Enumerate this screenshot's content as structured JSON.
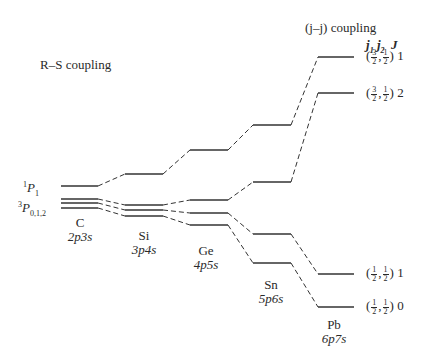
{
  "titles": {
    "rs": "R–S coupling",
    "jj": "(j–j) coupling"
  },
  "jj_header": {
    "j1": "j",
    "j1_sub": "1",
    "j2": "j",
    "j2_sub": "2",
    "J": "J"
  },
  "rs_terms": {
    "singlet": {
      "sup": "1",
      "letter": "P",
      "sub": "1"
    },
    "triplet": {
      "sup": "3",
      "letter": "P",
      "sub": "0,1,2"
    }
  },
  "elements": [
    {
      "symbol": "C",
      "config": "2p3s"
    },
    {
      "symbol": "Si",
      "config": "3p4s"
    },
    {
      "symbol": "Ge",
      "config": "4p5s"
    },
    {
      "symbol": "Sn",
      "config": "5p6s"
    },
    {
      "symbol": "Pb",
      "config": "6p7s"
    }
  ],
  "jj_states": [
    {
      "j1_num": "3",
      "j1_den": "2",
      "j2_num": "1",
      "j2_den": "2",
      "J": "1"
    },
    {
      "j1_num": "3",
      "j1_den": "2",
      "j2_num": "1",
      "j2_den": "2",
      "J": "2"
    },
    {
      "j1_num": "1",
      "j1_den": "2",
      "j2_num": "1",
      "j2_den": "2",
      "J": "1"
    },
    {
      "j1_num": "1",
      "j1_den": "2",
      "j2_num": "1",
      "j2_den": "2",
      "J": "0"
    }
  ]
}
